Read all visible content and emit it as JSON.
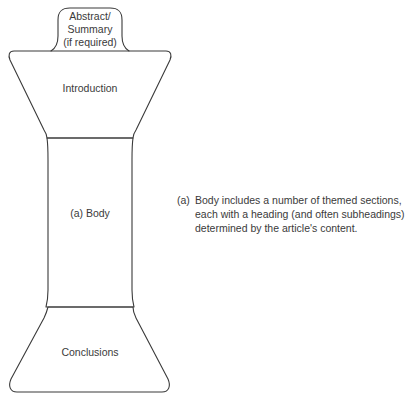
{
  "diagram": {
    "type": "article-structure-hourglass",
    "shapes": {
      "abstract": {
        "lines": [
          "Abstract/",
          "Summary",
          "(if required)"
        ]
      },
      "introduction": {
        "label": "Introduction"
      },
      "body": {
        "label": "(a) Body"
      },
      "conclusions": {
        "label": "Conclusions"
      }
    },
    "annotation": {
      "marker": "(a)",
      "lines": [
        "Body includes a number of themed sections,",
        "each with a heading (and often subheadings)",
        "determined by the article's content."
      ]
    },
    "colors": {
      "stroke": "#3a3a3a",
      "text": "#3a3a3a",
      "background": "#ffffff"
    }
  }
}
